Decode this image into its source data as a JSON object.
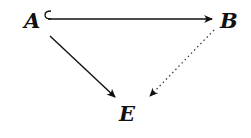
{
  "diagram": {
    "type": "commutative-diagram",
    "nodes": [
      {
        "id": "A",
        "label": "A"
      },
      {
        "id": "B",
        "label": "B"
      },
      {
        "id": "E",
        "label": "E"
      }
    ],
    "edges": [
      {
        "from": "A",
        "to": "B",
        "style": "hook-arrow (inclusion)"
      },
      {
        "from": "A",
        "to": "E",
        "style": "solid arrow"
      },
      {
        "from": "B",
        "to": "E",
        "style": "dotted arrow"
      }
    ]
  }
}
